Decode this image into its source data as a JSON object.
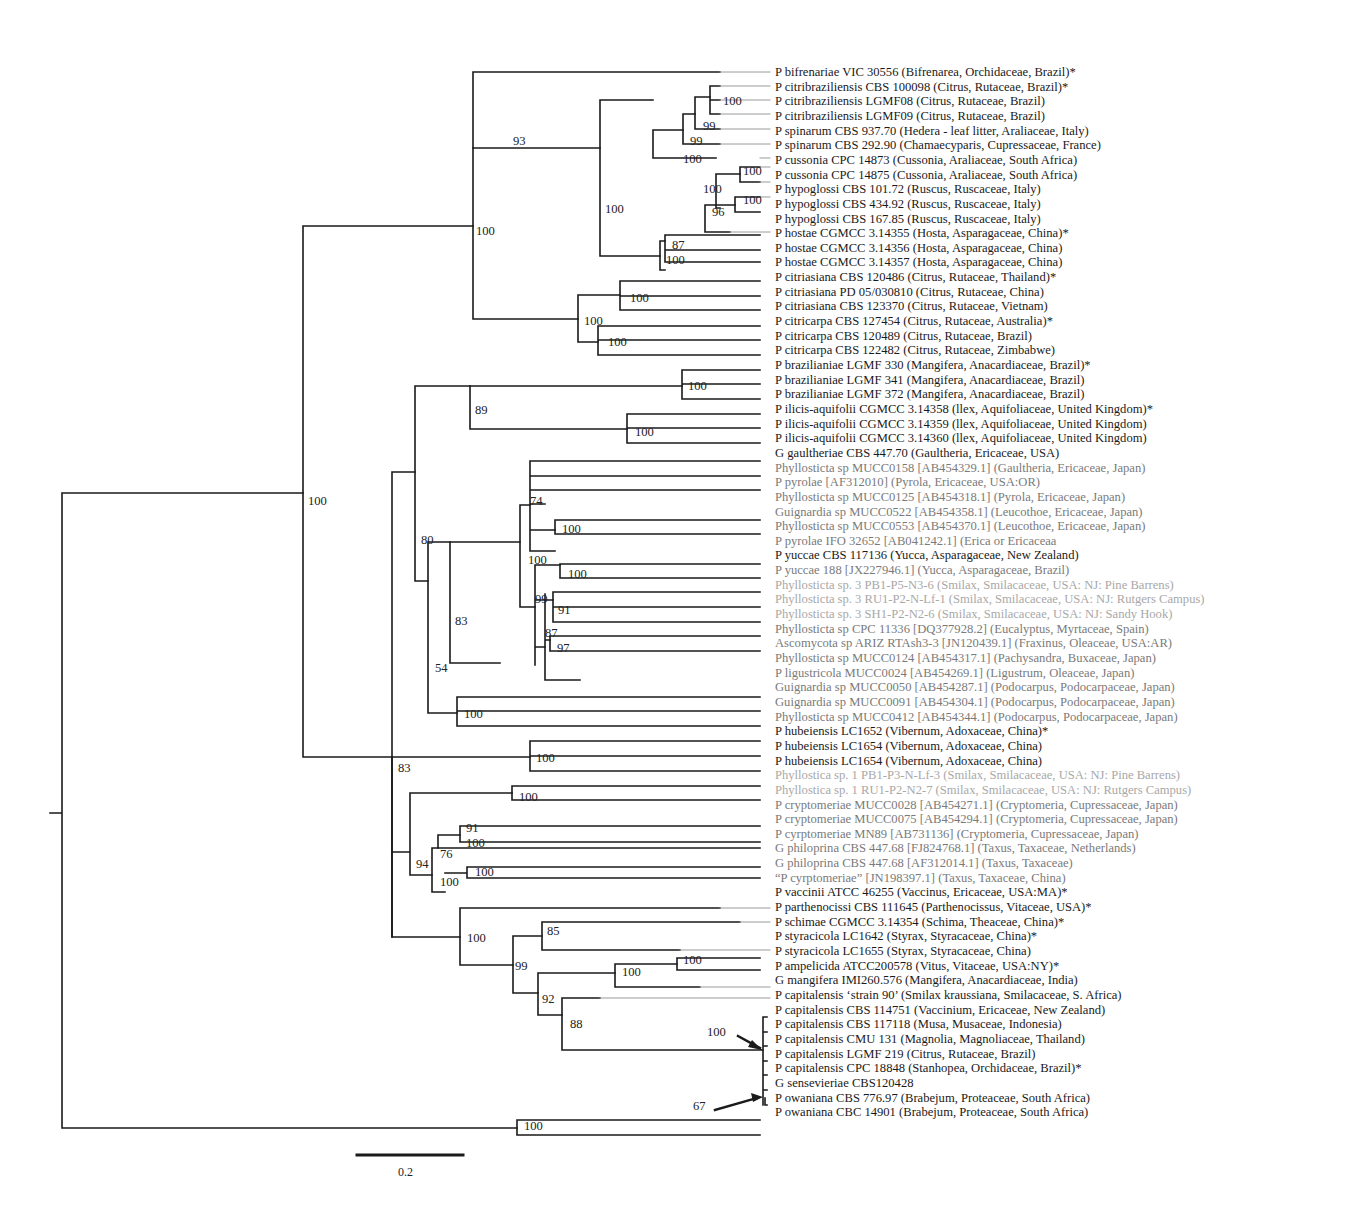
{
  "figure": {
    "type": "phylogenetic-tree",
    "scale_bar": {
      "label": "0.2"
    }
  },
  "colors": {
    "dark": "#1a1a1a",
    "gray": "#7a7a7a",
    "light": "#a8a8a8"
  },
  "taxa": [
    {
      "label": "P bifrenariae VIC 30556 (Bifrenarea, Orchidaceae, Brazil)*",
      "tone": "dark"
    },
    {
      "label": "P citribraziliensis CBS 100098 (Citrus, Rutaceae, Brazil)*",
      "tone": "dark"
    },
    {
      "label": "P citribraziliensis LGMF08 (Citrus, Rutaceae, Brazil)",
      "tone": "dark"
    },
    {
      "label": "P citribraziliensis LGMF09 (Citrus, Rutaceae, Brazil)",
      "tone": "dark"
    },
    {
      "label": "P spinarum CBS 937.70 (Hedera - leaf litter, Araliaceae, Italy)",
      "tone": "dark"
    },
    {
      "label": "P spinarum CBS 292.90 (Chamaecyparis, Cupressaceae, France)",
      "tone": "dark"
    },
    {
      "label": "P cussonia CPC 14873 (Cussonia, Araliaceae, South Africa)",
      "tone": "dark"
    },
    {
      "label": "P cussonia CPC 14875 (Cussonia, Araliaceae, South Africa)",
      "tone": "dark"
    },
    {
      "label": "P hypoglossi CBS 101.72 (Ruscus, Ruscaceae, Italy)",
      "tone": "dark"
    },
    {
      "label": "P hypoglossi CBS 434.92 (Ruscus, Ruscaceae, Italy)",
      "tone": "dark"
    },
    {
      "label": "P hypoglossi CBS 167.85 (Ruscus, Ruscaceae, Italy)",
      "tone": "dark"
    },
    {
      "label": "P hostae CGMCC 3.14355 (Hosta, Asparagaceae, China)*",
      "tone": "dark"
    },
    {
      "label": "P hostae CGMCC 3.14356 (Hosta, Asparagaceae, China)",
      "tone": "dark"
    },
    {
      "label": "P hostae CGMCC 3.14357 (Hosta, Asparagaceae, China)",
      "tone": "dark"
    },
    {
      "label": "P citriasiana CBS 120486 (Citrus, Rutaceae, Thailand)*",
      "tone": "dark"
    },
    {
      "label": "P citriasiana PD 05/030810 (Citrus, Rutaceae,  China)",
      "tone": "dark"
    },
    {
      "label": "P citriasiana CBS 123370 (Citrus, Rutaceae,  Vietnam)",
      "tone": "dark"
    },
    {
      "label": "P citricarpa CBS 127454 (Citrus, Rutaceae,  Australia)*",
      "tone": "dark"
    },
    {
      "label": "P citricarpa CBS 120489 (Citrus, Rutaceae,  Brazil)",
      "tone": "dark"
    },
    {
      "label": "P citricarpa CBS 122482 (Citrus, Rutaceae,  Zimbabwe)",
      "tone": "dark"
    },
    {
      "label": "P brazilianiae LGMF 330 (Mangifera, Anacardiaceae, Brazil)*",
      "tone": "dark"
    },
    {
      "label": "P brazilianiae LGMF 341 (Mangifera, Anacardiaceae, Brazil)",
      "tone": "dark"
    },
    {
      "label": "P brazilianiae LGMF 372 (Mangifera, Anacardiaceae, Brazil)",
      "tone": "dark"
    },
    {
      "label": "P ilicis-aquifolii CGMCC 3.14358 (llex, Aquifoliaceae, United Kingdom)*",
      "tone": "dark"
    },
    {
      "label": "P ilicis-aquifolii CGMCC 3.14359 (llex, Aquifoliaceae, United Kingdom)",
      "tone": "dark"
    },
    {
      "label": "P ilicis-aquifolii CGMCC 3.14360 (llex, Aquifoliaceae, United Kingdom)",
      "tone": "dark"
    },
    {
      "label": "G gaultheriae CBS 447.70 (Gaultheria, Ericaceae, USA)",
      "tone": "dark"
    },
    {
      "label": "Phyllosticta sp MUCC0158 [AB454329.1] (Gaultheria, Ericaceae, Japan)",
      "tone": "gray"
    },
    {
      "label": "P pyrolae [AF312010] (Pyrola, Ericaceae, USA:OR)",
      "tone": "gray"
    },
    {
      "label": "Phyllosticta sp MUCC0125 [AB454318.1] (Pyrola, Ericaceae, Japan)",
      "tone": "gray"
    },
    {
      "label": "Guignardia sp MUCC0522 [AB454358.1] (Leucothoe, Ericaceae, Japan)",
      "tone": "gray"
    },
    {
      "label": "Phyllosticta sp MUCC0553 [AB454370.1] (Leucothoe, Ericaceae, Japan)",
      "tone": "gray"
    },
    {
      "label": "P pyrolae IFO 32652 [AB041242.1] (Erica or Ericaceaa",
      "tone": "gray"
    },
    {
      "label": "P yuccae CBS 117136 (Yucca, Asparagaceae, New Zealand)",
      "tone": "dark"
    },
    {
      "label": "P yuccae 188 [JX227946.1] (Yucca, Asparagaceae, Brazil)",
      "tone": "gray"
    },
    {
      "label": "Phyllosticta sp. 3 PB1-P5-N3-6 (Smilax, Smilacaceae, USA: NJ: Pine Barrens)",
      "tone": "light"
    },
    {
      "label": "Phyllosticta sp. 3 RU1-P2-N-Lf-1 (Smilax, Smilacaceae, USA: NJ: Rutgers Campus)",
      "tone": "light"
    },
    {
      "label": "Phyllosticta sp. 3 SH1-P2-N2-6 (Smilax, Smilacaceae, USA: NJ: Sandy Hook)",
      "tone": "light"
    },
    {
      "label": "Phyllosticta sp CPC 11336 [DQ377928.2] (Eucalyptus, Myrtaceae, Spain)",
      "tone": "gray"
    },
    {
      "label": "Ascomycota sp ARIZ RTAsh3-3 [JN120439.1] (Fraxinus, Oleaceae, USA:AR)",
      "tone": "gray"
    },
    {
      "label": "Phyllosticta sp MUCC0124 [AB454317.1] (Pachysandra, Buxaceae, Japan)",
      "tone": "gray"
    },
    {
      "label": "P ligustricola MUCC0024 [AB454269.1] (Ligustrum, Oleaceae, Japan)",
      "tone": "gray"
    },
    {
      "label": "Guignardia sp MUCC0050 [AB454287.1] (Podocarpus, Podocarpaceae, Japan)",
      "tone": "gray"
    },
    {
      "label": "Guignardia sp MUCC0091 [AB454304.1] (Podocarpus, Podocarpaceae, Japan)",
      "tone": "gray"
    },
    {
      "label": "Phyllosticta sp MUCC0412 [AB454344.1] (Podocarpus, Podocarpaceae, Japan)",
      "tone": "gray"
    },
    {
      "label": "P hubeiensis LC1652 (Vibernum, Adoxaceae, China)*",
      "tone": "dark"
    },
    {
      "label": "P hubeiensis LC1654 (Vibernum, Adoxaceae, China)",
      "tone": "dark"
    },
    {
      "label": "P hubeiensis LC1654 (Vibernum, Adoxaceae, China)",
      "tone": "dark"
    },
    {
      "label": "Phyllostica sp. 1 PB1-P3-N-Lf-3 (Smilax, Smilacaceae, USA: NJ: Pine Barrens)",
      "tone": "light"
    },
    {
      "label": "Phyllostica sp. 1 RU1-P2-N2-7 (Smilax, Smilacaceae, USA: NJ: Rutgers Campus)",
      "tone": "light"
    },
    {
      "label": "P cryptomeriae MUCC0028 [AB454271.1] (Cryptomeria, Cupressaceae, Japan)",
      "tone": "gray"
    },
    {
      "label": "P cryptomeriae MUCC0075 [AB454294.1] (Cryptomeria, Cupressaceae, Japan)",
      "tone": "gray"
    },
    {
      "label": "P cyrptomeriae MN89 [AB731136] (Cryptomeria, Cupressaceae, Japan)",
      "tone": "gray"
    },
    {
      "label": "G philoprina CBS 447.68 [FJ824768.1] (Taxus, Taxaceae, Netherlands)",
      "tone": "gray"
    },
    {
      "label": "G philoprina CBS 447.68 [AF312014.1] (Taxus, Taxaceae)",
      "tone": "gray"
    },
    {
      "label": "“P cyrptomeriae” [JN198397.1] (Taxus, Taxaceae, China)",
      "tone": "gray"
    },
    {
      "label": "P vaccinii ATCC 46255 (Vaccinus, Ericaceae, USA:MA)*",
      "tone": "dark"
    },
    {
      "label": "P parthenocissi CBS 111645 (Parthenocissus, Vitaceae, USA)*",
      "tone": "dark"
    },
    {
      "label": "P schimae CGMCC 3.14354 (Schima, Theaceae, China)*",
      "tone": "dark"
    },
    {
      "label": "P styracicola LC1642 (Styrax, Styracaceae, China)*",
      "tone": "dark"
    },
    {
      "label": "P styracicola LC1655 (Styrax, Styracaceae, China)",
      "tone": "dark"
    },
    {
      "label": "P ampelicida ATCC200578 (Vitus, Vitaceae, USA:NY)*",
      "tone": "dark"
    },
    {
      "label": "G mangifera IMI260.576 (Mangifera, Anacardiaceae, India)",
      "tone": "dark"
    },
    {
      "label": "P capitalensis ‘strain 90’ (Smilax kraussiana, Smilacaceae, S. Africa)",
      "tone": "dark"
    },
    {
      "label": "P capitalensis CBS 114751 (Vaccinium, Ericaceae, New Zealand)",
      "tone": "dark"
    },
    {
      "label": "P capitalensis CBS 117118 (Musa, Musaceae, Indonesia)",
      "tone": "dark"
    },
    {
      "label": "P capitalensis CMU 131 (Magnolia, Magnoliaceae, Thailand)",
      "tone": "dark"
    },
    {
      "label": "P capitalensis LGMF 219 (Citrus, Rutaceae, Brazil)",
      "tone": "dark"
    },
    {
      "label": "P capitalensis CPC 18848 (Stanhopea, Orchidaceae, Brazil)*",
      "tone": "dark"
    },
    {
      "label": "G sensevieriae CBS120428",
      "tone": "dark"
    },
    {
      "label": "P owaniana CBS 776.97 (Brabejum, Proteaceae, South Africa)",
      "tone": "dark"
    },
    {
      "label": "P owaniana CBC 14901 (Brabejum, Proteaceae, South Africa)",
      "tone": "dark"
    }
  ],
  "bootstrap": [
    {
      "value": "93",
      "x": 513,
      "y": 145
    },
    {
      "value": "100",
      "x": 605,
      "y": 213
    },
    {
      "value": "100",
      "x": 723,
      "y": 105
    },
    {
      "value": "99",
      "x": 703,
      "y": 130
    },
    {
      "value": "99",
      "x": 690,
      "y": 145
    },
    {
      "value": "100",
      "x": 683,
      "y": 163
    },
    {
      "value": "100",
      "x": 743,
      "y": 175
    },
    {
      "value": "100",
      "x": 703,
      "y": 193
    },
    {
      "value": "96",
      "x": 712,
      "y": 216
    },
    {
      "value": "100",
      "x": 743,
      "y": 204
    },
    {
      "value": "87",
      "x": 672,
      "y": 249
    },
    {
      "value": "100",
      "x": 666,
      "y": 264
    },
    {
      "value": "100",
      "x": 476,
      "y": 235
    },
    {
      "value": "100",
      "x": 308,
      "y": 505
    },
    {
      "value": "100",
      "x": 630,
      "y": 302
    },
    {
      "value": "100",
      "x": 584,
      "y": 325
    },
    {
      "value": "100",
      "x": 608,
      "y": 346
    },
    {
      "value": "100",
      "x": 688,
      "y": 390
    },
    {
      "value": "89",
      "x": 475,
      "y": 414
    },
    {
      "value": "100",
      "x": 635,
      "y": 436
    },
    {
      "value": "74",
      "x": 530,
      "y": 505
    },
    {
      "value": "100",
      "x": 562,
      "y": 533
    },
    {
      "value": "100",
      "x": 528,
      "y": 564
    },
    {
      "value": "100",
      "x": 568,
      "y": 578
    },
    {
      "value": "80",
      "x": 421,
      "y": 544
    },
    {
      "value": "99",
      "x": 535,
      "y": 603
    },
    {
      "value": "91",
      "x": 558,
      "y": 614
    },
    {
      "value": "87",
      "x": 545,
      "y": 637
    },
    {
      "value": "97",
      "x": 557,
      "y": 652
    },
    {
      "value": "83",
      "x": 455,
      "y": 625
    },
    {
      "value": "54",
      "x": 435,
      "y": 672
    },
    {
      "value": "100",
      "x": 464,
      "y": 718
    },
    {
      "value": "100",
      "x": 536,
      "y": 762
    },
    {
      "value": "83",
      "x": 398,
      "y": 772
    },
    {
      "value": "100",
      "x": 519,
      "y": 801
    },
    {
      "value": "91",
      "x": 466,
      "y": 832
    },
    {
      "value": "100",
      "x": 466,
      "y": 847
    },
    {
      "value": "94",
      "x": 416,
      "y": 868
    },
    {
      "value": "76",
      "x": 440,
      "y": 858
    },
    {
      "value": "100",
      "x": 475,
      "y": 876
    },
    {
      "value": "100",
      "x": 440,
      "y": 886
    },
    {
      "value": "100",
      "x": 467,
      "y": 942
    },
    {
      "value": "85",
      "x": 547,
      "y": 935
    },
    {
      "value": "100",
      "x": 683,
      "y": 964
    },
    {
      "value": "100",
      "x": 622,
      "y": 976
    },
    {
      "value": "99",
      "x": 515,
      "y": 970
    },
    {
      "value": "92",
      "x": 542,
      "y": 1003
    },
    {
      "value": "88",
      "x": 570,
      "y": 1028
    },
    {
      "value": "100",
      "x": 707,
      "y": 1036
    },
    {
      "value": "67",
      "x": 693,
      "y": 1110
    },
    {
      "value": "100",
      "x": 524,
      "y": 1130
    }
  ]
}
